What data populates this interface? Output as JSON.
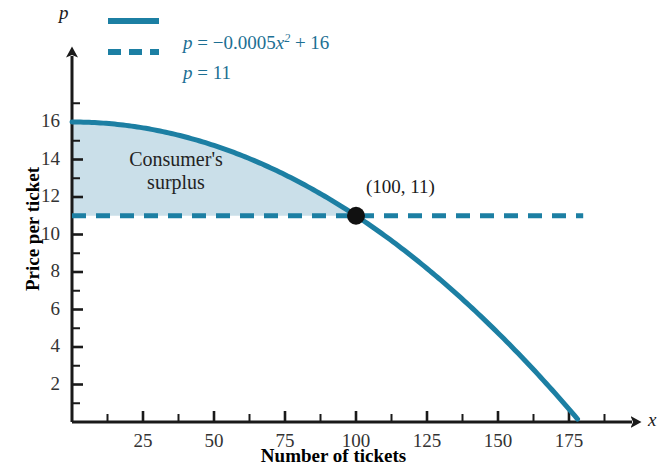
{
  "chart_data": {
    "type": "line",
    "title": "",
    "xlabel": "Number of tickets",
    "ylabel": "Price per ticket",
    "x_axis_var": "x",
    "y_axis_var": "p",
    "xlim": [
      0,
      200
    ],
    "ylim": [
      0,
      17.5
    ],
    "xticks": [
      25,
      50,
      75,
      100,
      125,
      150,
      175
    ],
    "yticks": [
      2,
      4,
      6,
      8,
      10,
      12,
      14,
      16
    ],
    "x_minor_step": 12.5,
    "y_minor_step": 1,
    "grid": false,
    "legend_position": "top-left-outside",
    "series": [
      {
        "name": "demand-curve",
        "legend_label": "p = −0.0005x² + 16",
        "equation": "p = -0.0005*x^2 + 16",
        "style": "solid",
        "color": "#1c7fa3",
        "x": [
          0,
          10,
          20,
          30,
          40,
          50,
          60,
          70,
          80,
          90,
          100,
          110,
          120,
          130,
          140,
          150,
          160,
          170,
          178.9
        ],
        "values": [
          16,
          15.95,
          15.8,
          15.55,
          15.2,
          14.75,
          14.2,
          13.55,
          12.8,
          11.95,
          11,
          9.95,
          8.8,
          7.55,
          6.2,
          4.75,
          3.2,
          1.55,
          0
        ]
      },
      {
        "name": "price-line",
        "legend_label": "p = 11",
        "equation": "p = 11",
        "style": "dashed",
        "color": "#1c7fa3",
        "x": [
          0,
          180
        ],
        "values": [
          11,
          11
        ]
      }
    ],
    "shaded_region": {
      "name": "Consumer's surplus",
      "color": "#cadfe9",
      "bounded_above_by": "demand-curve",
      "bounded_below_by": "price-line",
      "x_range": [
        0,
        100
      ]
    },
    "annotations": [
      {
        "name": "equilibrium-point",
        "label": "(100, 11)",
        "x": 100,
        "y": 11,
        "marker": "filled-circle",
        "marker_color": "#111111"
      },
      {
        "name": "surplus-region-label",
        "label_line1": "Consumer's",
        "label_line2": "surplus",
        "x": 28,
        "y": 13.2
      }
    ]
  },
  "legend": {
    "entries": [
      {
        "label_full": "p = −0.0005x² + 16",
        "lhs": "p",
        "eq": " = ",
        "rhs_pre": "−0.0005",
        "rhs_var": "x",
        "rhs_exp": "2",
        "rhs_post": " + 16",
        "style": "solid",
        "color": "#1c7fa3"
      },
      {
        "label_full": "p = 11",
        "lhs": "p",
        "eq": " = ",
        "rhs_pre": "11",
        "style": "dashed",
        "color": "#1c7fa3"
      }
    ]
  },
  "axes": {
    "x_title": "Number of tickets",
    "y_title": "Price per ticket",
    "x_var": "x",
    "y_var": "p",
    "x_tick_labels": [
      "25",
      "50",
      "75",
      "100",
      "125",
      "150",
      "175"
    ],
    "y_tick_labels": [
      "2",
      "4",
      "6",
      "8",
      "10",
      "12",
      "14",
      "16"
    ]
  },
  "annotations": {
    "point_label": "(100, 11)",
    "surplus_line1": "Consumer's",
    "surplus_line2": "surplus"
  },
  "colors": {
    "curve": "#1c7fa3",
    "shade": "#cadfe9",
    "axis": "#1a1a1a",
    "point": "#111111",
    "legend_text": "#1c6f93"
  }
}
